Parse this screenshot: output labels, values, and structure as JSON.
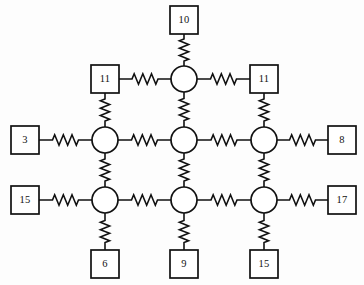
{
  "figure": {
    "type": "circuit-lattice-diagram",
    "background_color": "#fdfdfd",
    "line_color": "#111111",
    "fill_color": "#ffffff",
    "width": 364,
    "height": 285
  },
  "nodes": [
    {
      "id": "n-top",
      "name": "node-top",
      "cx": 184,
      "cy": 79,
      "r": 13
    },
    {
      "id": "n-mid-left",
      "name": "node-mid-left",
      "cx": 105,
      "cy": 140,
      "r": 13
    },
    {
      "id": "n-mid-center",
      "name": "node-mid-center",
      "cx": 184,
      "cy": 140,
      "r": 13
    },
    {
      "id": "n-mid-right",
      "name": "node-mid-right",
      "cx": 264,
      "cy": 140,
      "r": 13
    },
    {
      "id": "n-bot-left",
      "name": "node-bottom-left",
      "cx": 105,
      "cy": 200,
      "r": 13
    },
    {
      "id": "n-bot-center",
      "name": "node-bottom-center",
      "cx": 184,
      "cy": 200,
      "r": 13
    },
    {
      "id": "n-bot-right",
      "name": "node-bottom-right",
      "cx": 264,
      "cy": 200,
      "r": 13
    }
  ],
  "terminals": [
    {
      "id": "t-top",
      "name": "terminal-box-top",
      "label": "10",
      "x": 170,
      "y": 6,
      "w": 28,
      "h": 28
    },
    {
      "id": "t-upper-left",
      "name": "terminal-box-upper-left",
      "label": "11",
      "x": 91,
      "y": 65,
      "w": 28,
      "h": 28
    },
    {
      "id": "t-upper-right",
      "name": "terminal-box-upper-right",
      "label": "11",
      "x": 250,
      "y": 65,
      "w": 28,
      "h": 28
    },
    {
      "id": "t-left-mid",
      "name": "terminal-box-left-middle",
      "label": "3",
      "x": 11,
      "y": 126,
      "w": 28,
      "h": 28
    },
    {
      "id": "t-right-mid",
      "name": "terminal-box-right-middle",
      "label": "8",
      "x": 328,
      "y": 126,
      "w": 28,
      "h": 28
    },
    {
      "id": "t-left-bot",
      "name": "terminal-box-left-bottom",
      "label": "15",
      "x": 11,
      "y": 186,
      "w": 28,
      "h": 28
    },
    {
      "id": "t-right-bot",
      "name": "terminal-box-right-bottom",
      "label": "17",
      "x": 328,
      "y": 186,
      "w": 28,
      "h": 28
    },
    {
      "id": "t-bottom-left",
      "name": "terminal-box-bottom-left",
      "label": "6",
      "x": 91,
      "y": 250,
      "w": 28,
      "h": 28
    },
    {
      "id": "t-bottom-center",
      "name": "terminal-box-bottom-center",
      "label": "9",
      "x": 170,
      "y": 250,
      "w": 28,
      "h": 28
    },
    {
      "id": "t-bottom-right",
      "name": "terminal-box-bottom-right",
      "label": "15",
      "x": 250,
      "y": 250,
      "w": 28,
      "h": 28
    }
  ],
  "resistors": [
    {
      "id": "r-top-vert",
      "name": "resistor-top-to-node-top",
      "orientation": "vertical",
      "x1": 184,
      "y1": 34,
      "x2": 184,
      "y2": 66
    },
    {
      "id": "r-upperleft-h",
      "name": "resistor-upper-left-horizontal",
      "orientation": "horizontal",
      "x1": 119,
      "y1": 79,
      "x2": 171,
      "y2": 79
    },
    {
      "id": "r-upperright-h",
      "name": "resistor-upper-right-horizontal",
      "orientation": "horizontal",
      "x1": 197,
      "y1": 79,
      "x2": 250,
      "y2": 79
    },
    {
      "id": "r-upperleft-v",
      "name": "resistor-upper-left-vertical",
      "orientation": "vertical",
      "x1": 105,
      "y1": 93,
      "x2": 105,
      "y2": 127
    },
    {
      "id": "r-center-v-top",
      "name": "resistor-center-vertical-upper",
      "orientation": "vertical",
      "x1": 184,
      "y1": 92,
      "x2": 184,
      "y2": 127
    },
    {
      "id": "r-upperright-v",
      "name": "resistor-upper-right-vertical",
      "orientation": "vertical",
      "x1": 264,
      "y1": 93,
      "x2": 264,
      "y2": 127
    },
    {
      "id": "r-leftmid-h",
      "name": "resistor-left-middle-horizontal",
      "orientation": "horizontal",
      "x1": 39,
      "y1": 140,
      "x2": 92,
      "y2": 140
    },
    {
      "id": "r-mid-h-1",
      "name": "resistor-middle-horizontal-left",
      "orientation": "horizontal",
      "x1": 118,
      "y1": 140,
      "x2": 171,
      "y2": 140
    },
    {
      "id": "r-mid-h-2",
      "name": "resistor-middle-horizontal-right",
      "orientation": "horizontal",
      "x1": 197,
      "y1": 140,
      "x2": 251,
      "y2": 140
    },
    {
      "id": "r-rightmid-h",
      "name": "resistor-right-middle-horizontal",
      "orientation": "horizontal",
      "x1": 277,
      "y1": 140,
      "x2": 328,
      "y2": 140
    },
    {
      "id": "r-left-v-mid",
      "name": "resistor-left-column-vertical",
      "orientation": "vertical",
      "x1": 105,
      "y1": 153,
      "x2": 105,
      "y2": 187
    },
    {
      "id": "r-center-v-mid",
      "name": "resistor-center-column-vertical",
      "orientation": "vertical",
      "x1": 184,
      "y1": 153,
      "x2": 184,
      "y2": 187
    },
    {
      "id": "r-right-v-mid",
      "name": "resistor-right-column-vertical",
      "orientation": "vertical",
      "x1": 264,
      "y1": 153,
      "x2": 264,
      "y2": 187
    },
    {
      "id": "r-leftbot-h",
      "name": "resistor-left-bottom-horizontal",
      "orientation": "horizontal",
      "x1": 39,
      "y1": 200,
      "x2": 92,
      "y2": 200
    },
    {
      "id": "r-bot-h-1",
      "name": "resistor-bottom-horizontal-left",
      "orientation": "horizontal",
      "x1": 118,
      "y1": 200,
      "x2": 171,
      "y2": 200
    },
    {
      "id": "r-bot-h-2",
      "name": "resistor-bottom-horizontal-right",
      "orientation": "horizontal",
      "x1": 197,
      "y1": 200,
      "x2": 251,
      "y2": 200
    },
    {
      "id": "r-rightbot-h",
      "name": "resistor-right-bottom-horizontal",
      "orientation": "horizontal",
      "x1": 277,
      "y1": 200,
      "x2": 328,
      "y2": 200
    },
    {
      "id": "r-botleft-v",
      "name": "resistor-bottom-left-vertical",
      "orientation": "vertical",
      "x1": 105,
      "y1": 213,
      "x2": 105,
      "y2": 250
    },
    {
      "id": "r-botcenter-v",
      "name": "resistor-bottom-center-vertical",
      "orientation": "vertical",
      "x1": 184,
      "y1": 213,
      "x2": 184,
      "y2": 250
    },
    {
      "id": "r-botright-v",
      "name": "resistor-bottom-right-vertical",
      "orientation": "vertical",
      "x1": 264,
      "y1": 213,
      "x2": 264,
      "y2": 250
    }
  ],
  "chart_data": {
    "type": "diagram",
    "title": "",
    "node_count": 7,
    "terminal_count": 10,
    "resistor_count": 20,
    "terminal_labels": [
      "10",
      "11",
      "11",
      "3",
      "8",
      "15",
      "17",
      "6",
      "9",
      "15"
    ],
    "terminal_values": [
      10,
      11,
      11,
      3,
      8,
      15,
      17,
      6,
      9,
      15
    ]
  }
}
